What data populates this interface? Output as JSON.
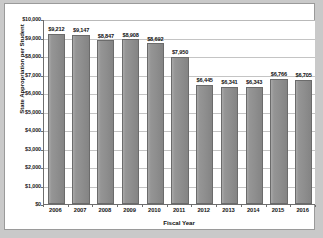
{
  "chart_data": {
    "type": "bar",
    "title": "",
    "xlabel": "Fiscal Year",
    "ylabel": "State Appropriation per Student",
    "categories": [
      "2006",
      "2007",
      "2008",
      "2009",
      "2010",
      "2011",
      "2012",
      "2013",
      "2014",
      "2015",
      "2016"
    ],
    "values": [
      9212,
      9147,
      8847,
      8908,
      8692,
      7950,
      6445,
      6341,
      6343,
      6766,
      6705
    ],
    "data_labels": [
      "$9,212",
      "$9,147",
      "$8,847",
      "$8,908",
      "$8,692",
      "$7,950",
      "$6,445",
      "$6,341",
      "$6,343",
      "$6,766",
      "$6,705"
    ],
    "ylim": [
      0,
      10000
    ],
    "ytick_values": [
      0,
      1000,
      2000,
      3000,
      4000,
      5000,
      6000,
      7000,
      8000,
      9000,
      10000
    ],
    "ytick_labels": [
      "$0",
      "$1,000",
      "$2,000",
      "$3,000",
      "$4,000",
      "$5,000",
      "$6,000",
      "$7,000",
      "$8,000",
      "$9,000",
      "$10,000"
    ],
    "grid": true,
    "legend": "none",
    "series_color": "#8e8e8e",
    "plot_background": "#ffffff",
    "page_background": "#c9c9c9"
  }
}
